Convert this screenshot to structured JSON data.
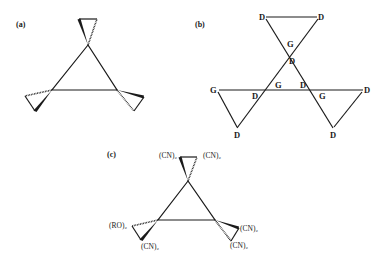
{
  "figure": {
    "panels": [
      {
        "id": "a",
        "label": "(a)",
        "description": "Triangular core with three spiro-fused cyclopropane rings shown with wedge/hash stereo bonds"
      },
      {
        "id": "b",
        "label": "(b)",
        "description": "Triangular network of donor (D) and guest/group (G) labelled vertices",
        "atoms": {
          "top_left": "D",
          "top_right": "D",
          "top_inner_g": "G",
          "top_inner_d": "D",
          "left_g": "G",
          "left_inner_d": "D",
          "center_left_g": "G",
          "center_right_d": "D",
          "right_inner_g": "G",
          "right_d": "D",
          "bottom_left_d": "D",
          "bottom_right_d": "D"
        }
      },
      {
        "id": "c",
        "label": "(c)",
        "description": "Substituted spiro-cyclopropane triangle",
        "substituents": {
          "top_left": "(CN)₂",
          "top_right": "(CN)₂",
          "left_upper": "(RO)₂",
          "left_lower": "(CN)₂",
          "right_upper": "(CN)₂",
          "right_lower": "(CN)₂"
        }
      }
    ]
  }
}
